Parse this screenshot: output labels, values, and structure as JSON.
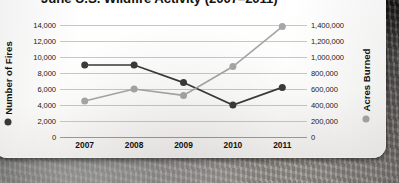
{
  "chart_data": {
    "type": "line",
    "title": "June U.S. Wildfire Activity (2007–2011)",
    "xlabel": "",
    "categories": [
      "2007",
      "2008",
      "2009",
      "2010",
      "2011"
    ],
    "grid": true,
    "legend_position": "axis-titles",
    "series": [
      {
        "name": "Number of Fires",
        "axis": "left",
        "color": "#3a3a3a",
        "marker": "circle",
        "values": [
          9000,
          9000,
          6800,
          4000,
          6200
        ]
      },
      {
        "name": "Acres Burned",
        "axis": "right",
        "color": "#a6a6a6",
        "marker": "circle",
        "values": [
          450000,
          600000,
          520000,
          880000,
          1380000
        ]
      }
    ],
    "left_axis": {
      "label": "Number of Fires",
      "ylim": [
        0,
        14000
      ],
      "step": 2000,
      "ticks": [
        "0",
        "2,000",
        "4,000",
        "6,000",
        "8,000",
        "10,000",
        "12,000",
        "14,000"
      ]
    },
    "right_axis": {
      "label": "Acres Burned",
      "ylim": [
        0,
        1400000
      ],
      "step": 200000,
      "ticks": [
        "0",
        "200,000",
        "400,000",
        "600,000",
        "800,000",
        "1,000,000",
        "1,200,000",
        "1,400,000"
      ]
    }
  }
}
